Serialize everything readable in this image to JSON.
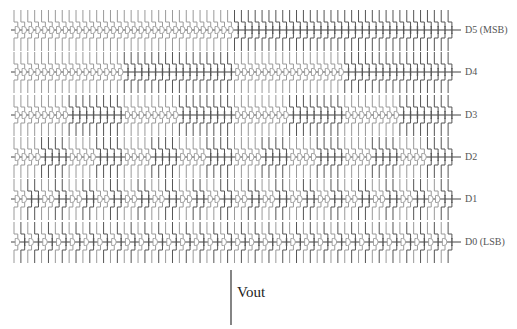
{
  "diagram": {
    "columns": 64,
    "grid": {
      "x0": 13,
      "x1": 454,
      "bus_end_x": 461
    },
    "colors": {
      "off_wire": "#9a9a9a",
      "on_wire": "#555555",
      "bus": "#444444"
    },
    "rows": [
      {
        "label": "D5 (MSB)",
        "y": 30,
        "period": 64
      },
      {
        "label": "D4",
        "y": 72,
        "period": 32
      },
      {
        "label": "D3",
        "y": 115,
        "period": 16
      },
      {
        "label": "D2",
        "y": 157,
        "period": 8
      },
      {
        "label": "D1",
        "y": 199,
        "period": 4
      },
      {
        "label": "D0 (LSB)",
        "y": 242,
        "period": 2
      }
    ],
    "output": {
      "label": "Vout",
      "x": 231,
      "y_top": 270,
      "y_bottom": 325
    }
  }
}
